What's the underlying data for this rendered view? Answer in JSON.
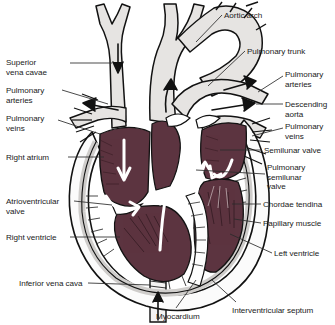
{
  "figure": {
    "type": "labeled-anatomical-diagram",
    "background_color": "#ffffff"
  },
  "palette": {
    "chamber_blood": "#5c3440",
    "chamber_blood_dark": "#46262f",
    "chamber_blood_light": "#6b4049",
    "vessel_fill": "#e6e4e2",
    "myocardium_fill": "#fbfbfb",
    "outline": "#121212",
    "flow_arrow_white": "#ffffff",
    "flow_arrow_black": "#121212",
    "label_text": "#1a1a1a",
    "leader_line": "#2b2b2b"
  },
  "labels": {
    "left": [
      {
        "id": "superior-vena-cavae",
        "text": "Superior\nvena cavae",
        "x": 6,
        "y": 58
      },
      {
        "id": "pulmonary-arteries-left",
        "text": "Pulmonary\narteries",
        "x": 6,
        "y": 86
      },
      {
        "id": "pulmonary-veins-left",
        "text": "Pulmonary\nveins",
        "x": 6,
        "y": 114
      },
      {
        "id": "right-atrium",
        "text": "Right atrium",
        "x": 6,
        "y": 153
      },
      {
        "id": "atrioventricular-valve",
        "text": "Atrioventricular\nvalve",
        "x": 6,
        "y": 197
      },
      {
        "id": "right-ventricle",
        "text": "Right ventricle",
        "x": 6,
        "y": 233
      },
      {
        "id": "inferior-vena-cava",
        "text": "Inferior vena cava",
        "x": 19,
        "y": 279
      }
    ],
    "right": [
      {
        "id": "aortic-arch",
        "text": "Aortic arch",
        "x": 224,
        "y": 11
      },
      {
        "id": "pulmonary-trunk",
        "text": "Pulmonary trunk",
        "x": 247,
        "y": 47
      },
      {
        "id": "pulmonary-arteries-right",
        "text": "Pulmonary\narteries",
        "x": 285,
        "y": 70
      },
      {
        "id": "descending-aorta",
        "text": "Descending\naorta",
        "x": 285,
        "y": 100
      },
      {
        "id": "pulmonary-veins-right",
        "text": "Pulmonary\nveins",
        "x": 285,
        "y": 122
      },
      {
        "id": "semilunar-valve",
        "text": "Semilunar valve",
        "x": 264,
        "y": 146
      },
      {
        "id": "pulmonary-semilunar-valve",
        "text": "Pulmonary\nsemilunar\nvalve",
        "x": 267,
        "y": 163
      },
      {
        "id": "chordae-tendina",
        "text": "Chordae tendina",
        "x": 263,
        "y": 200
      },
      {
        "id": "papillary-muscle",
        "text": "Papillary muscle",
        "x": 263,
        "y": 219
      },
      {
        "id": "left-ventricle",
        "text": "Left ventricle",
        "x": 274,
        "y": 249
      }
    ],
    "bottom": [
      {
        "id": "myocardium",
        "text": "Myocardium",
        "x": 156,
        "y": 312
      },
      {
        "id": "interventricular-septum",
        "text": "Interventricular septum",
        "x": 232,
        "y": 306
      }
    ]
  },
  "structures": [
    {
      "id": "superior-vena-cava",
      "name": "Superior vena cava"
    },
    {
      "id": "aortic-arch",
      "name": "Aortic arch"
    },
    {
      "id": "pulmonary-trunk",
      "name": "Pulmonary trunk"
    },
    {
      "id": "descending-aorta",
      "name": "Descending aorta"
    },
    {
      "id": "right-atrium",
      "name": "Right atrium"
    },
    {
      "id": "left-atrium",
      "name": "Left atrium"
    },
    {
      "id": "right-ventricle",
      "name": "Right ventricle"
    },
    {
      "id": "left-ventricle",
      "name": "Left ventricle"
    },
    {
      "id": "interventricular-septum",
      "name": "Interventricular septum"
    },
    {
      "id": "myocardium",
      "name": "Myocardium"
    },
    {
      "id": "inferior-vena-cava",
      "name": "Inferior vena cava"
    }
  ]
}
